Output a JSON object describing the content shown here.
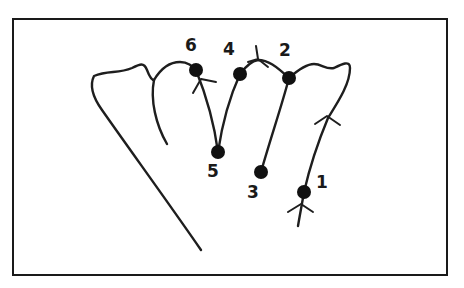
{
  "diagram": {
    "type": "hand-outline-sequence",
    "colors": {
      "line": "#1e1e1e",
      "dot": "#111111",
      "frame": "#1a1a1a",
      "background": "#ffffff"
    },
    "points": [
      {
        "id": 1,
        "label": "1",
        "x": 304,
        "y": 192,
        "label_x": 316,
        "label_y": 174
      },
      {
        "id": 2,
        "label": "2",
        "x": 289,
        "y": 78,
        "label_x": 279,
        "label_y": 42
      },
      {
        "id": 3,
        "label": "3",
        "x": 261,
        "y": 172,
        "label_x": 247,
        "label_y": 184
      },
      {
        "id": 4,
        "label": "4",
        "x": 240,
        "y": 74,
        "label_x": 223,
        "label_y": 41
      },
      {
        "id": 5,
        "label": "5",
        "x": 218,
        "y": 152,
        "label_x": 207,
        "label_y": 163
      },
      {
        "id": 6,
        "label": "6",
        "x": 196,
        "y": 70,
        "label_x": 185,
        "label_y": 37
      }
    ],
    "arrows": [
      {
        "name": "arrow-start-bottom",
        "at_x": 301,
        "at_y": 210,
        "direction": "up"
      },
      {
        "name": "arrow-right-finger",
        "at_x": 326,
        "at_y": 117,
        "direction": "up"
      },
      {
        "name": "arrow-top-between-4-2",
        "at_x": 258,
        "at_y": 58,
        "direction": "left"
      },
      {
        "name": "arrow-at-6",
        "at_x": 201,
        "at_y": 80,
        "direction": "up"
      }
    ]
  }
}
